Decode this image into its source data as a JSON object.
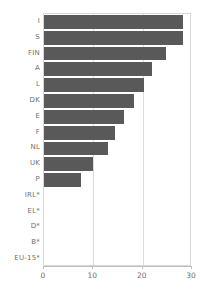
{
  "chart_data": {
    "type": "bar",
    "orientation": "horizontal",
    "title": "",
    "subtitle": "",
    "xlabel": "",
    "ylabel": "",
    "xlim": [
      0,
      30
    ],
    "ylim": null,
    "grid": "vertical",
    "legend": "none",
    "xticks": [
      0,
      10,
      20,
      30
    ],
    "xtick_labels": [
      "0",
      "10",
      "20",
      "30"
    ],
    "bar_color": "#595959",
    "plot_border_color": "#d8d8d8",
    "gridline_color": "#dcdcdc",
    "categories": [
      "I",
      "S",
      "FIN",
      "A",
      "L",
      "DK",
      "E",
      "F",
      "NL",
      "UK",
      "P",
      "IRL*",
      "EL*",
      "D*",
      "B*",
      "EU-15*"
    ],
    "values": [
      28.2,
      28.2,
      24.7,
      21.8,
      20.2,
      18.2,
      16.3,
      14.3,
      12.9,
      10.0,
      7.6,
      0,
      0,
      0,
      0,
      0
    ],
    "series": [
      {
        "name": "",
        "values": [
          28.2,
          28.2,
          24.7,
          21.8,
          20.2,
          18.2,
          16.3,
          14.3,
          12.9,
          10.0,
          7.6,
          0,
          0,
          0,
          0,
          0
        ]
      }
    ],
    "annotations": []
  }
}
